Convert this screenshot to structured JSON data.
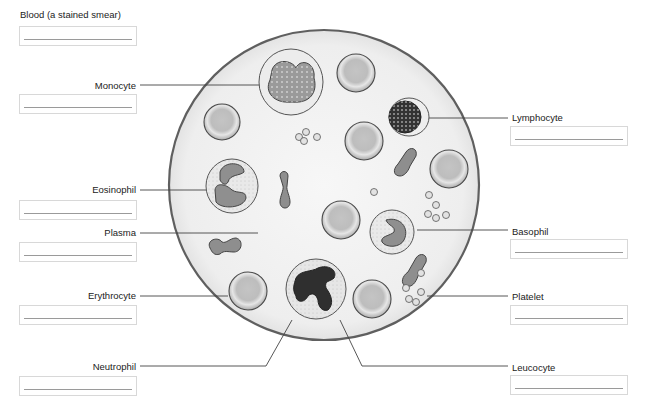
{
  "title": "Blood (a stained smear)",
  "labels": {
    "monocyte": "Monocyte",
    "lymphocyte": "Lymphocyte",
    "eosinophil": "Eosinophil",
    "plasma": "Plasma",
    "basophil": "Basophil",
    "erythrocyte": "Erythrocyte",
    "platelet": "Platelet",
    "neutrophil": "Neutrophil",
    "leucocyte": "Leucocyte"
  },
  "answer_boxes": {
    "blood": "",
    "monocyte": "",
    "lymphocyte": "",
    "eosinophil": "",
    "plasma": "",
    "basophil": "",
    "erythrocyte": "",
    "platelet": "",
    "neutrophil": "",
    "leucocyte": ""
  },
  "colors": {
    "smear_fill": "#f1f1f1",
    "outline": "#555555",
    "rbc_fill": "#b8b8b8",
    "nucleus_gray": "#8e8e8e",
    "nucleus_dark": "#333333"
  }
}
